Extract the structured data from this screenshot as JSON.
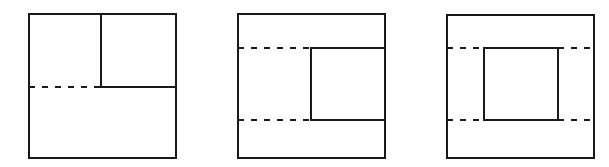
{
  "figure": {
    "stroke_color": "#1a1a1a",
    "background": "#ffffff",
    "panels": [
      {
        "id": "panel-1",
        "outer": {
          "x": 29,
          "y": 14,
          "w": 147,
          "h": 144
        },
        "solid_lines": [
          {
            "x1": 101,
            "y1": 14,
            "x2": 101,
            "y2": 87
          },
          {
            "x1": 101,
            "y1": 87,
            "x2": 176,
            "y2": 87
          }
        ],
        "dashed_lines": [
          {
            "x1": 29,
            "y1": 87,
            "x2": 101,
            "y2": 87
          }
        ]
      },
      {
        "id": "panel-2",
        "outer": {
          "x": 238,
          "y": 14,
          "w": 147,
          "h": 144
        },
        "solid_lines": [
          {
            "x1": 311,
            "y1": 48,
            "x2": 385,
            "y2": 48
          },
          {
            "x1": 311,
            "y1": 48,
            "x2": 311,
            "y2": 120
          },
          {
            "x1": 311,
            "y1": 120,
            "x2": 385,
            "y2": 120
          }
        ],
        "dashed_lines": [
          {
            "x1": 238,
            "y1": 48,
            "x2": 311,
            "y2": 48
          },
          {
            "x1": 238,
            "y1": 120,
            "x2": 311,
            "y2": 120
          }
        ]
      },
      {
        "id": "panel-3",
        "outer": {
          "x": 447,
          "y": 15,
          "w": 147,
          "h": 143
        },
        "solid_lines": [
          {
            "x1": 484,
            "y1": 48,
            "x2": 558,
            "y2": 48
          },
          {
            "x1": 558,
            "y1": 48,
            "x2": 558,
            "y2": 120
          },
          {
            "x1": 558,
            "y1": 120,
            "x2": 484,
            "y2": 120
          },
          {
            "x1": 484,
            "y1": 120,
            "x2": 484,
            "y2": 48
          }
        ],
        "dashed_lines": [
          {
            "x1": 447,
            "y1": 48,
            "x2": 484,
            "y2": 48
          },
          {
            "x1": 558,
            "y1": 48,
            "x2": 594,
            "y2": 48
          },
          {
            "x1": 447,
            "y1": 120,
            "x2": 484,
            "y2": 120
          },
          {
            "x1": 558,
            "y1": 120,
            "x2": 594,
            "y2": 120
          }
        ]
      }
    ]
  }
}
